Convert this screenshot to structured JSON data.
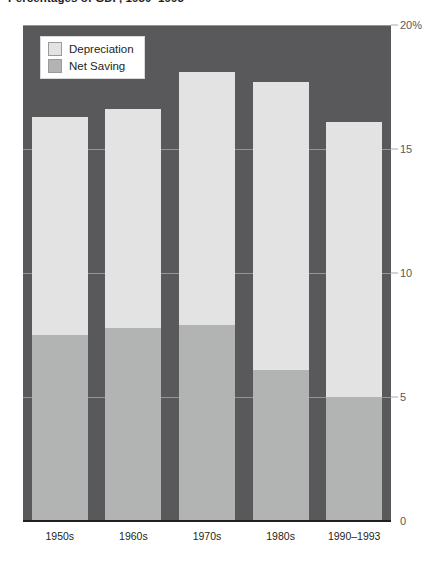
{
  "title": "Percentages of GDP, 1950–1993",
  "legend": {
    "items": [
      {
        "label": "Depreciation",
        "color": "#e3e3e3"
      },
      {
        "label": "Net Saving",
        "color": "#b2b3b3"
      }
    ]
  },
  "axis": {
    "y_ticks": [
      "20%",
      "15",
      "10",
      "5",
      "0"
    ],
    "y_values": [
      20,
      15,
      10,
      5,
      0
    ],
    "x_ticks": [
      "1950s",
      "1960s",
      "1970s",
      "1980s",
      "1990–1993"
    ]
  },
  "colors": {
    "plot_background": "#59595b",
    "depreciation": "#e3e3e3",
    "net_saving": "#b2b3b3",
    "gridline": "#a7a9ac",
    "baseline": "#231f20",
    "tick_text": "#58595b",
    "label_text": "#231f20"
  },
  "chart_data": {
    "type": "bar",
    "stacked": true,
    "title": "Percentages of GDP, 1950–1993",
    "xlabel": "",
    "ylabel": "",
    "ylim": [
      0,
      20
    ],
    "yticks": [
      0,
      5,
      10,
      15,
      20
    ],
    "ytick_labels": [
      "0",
      "5",
      "10",
      "15",
      "20%"
    ],
    "grid": true,
    "legend_position": "top-left-inside",
    "categories": [
      "1950s",
      "1960s",
      "1970s",
      "1980s",
      "1990–1993"
    ],
    "series": [
      {
        "name": "Net Saving",
        "color": "#b2b3b3",
        "values": [
          7.5,
          7.8,
          7.9,
          6.1,
          5.0
        ]
      },
      {
        "name": "Depreciation",
        "color": "#e3e3e3",
        "values": [
          8.8,
          8.8,
          10.2,
          11.6,
          11.1
        ]
      }
    ],
    "totals": [
      16.3,
      16.6,
      18.1,
      17.7,
      16.1
    ]
  }
}
